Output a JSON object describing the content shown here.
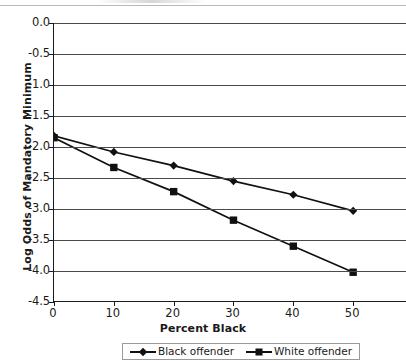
{
  "chart_data": {
    "type": "line",
    "title": "",
    "xlabel": "Percent Black",
    "ylabel": "Log Odds of Mandatory Minimum",
    "x": [
      0,
      10,
      20,
      30,
      40,
      50
    ],
    "xlim": [
      0,
      59
    ],
    "ylim": [
      -4.5,
      0.0
    ],
    "grid": true,
    "legend_position": "bottom",
    "xticks": [
      "0",
      "10",
      "20",
      "30",
      "40",
      "50"
    ],
    "yticks": [
      "0.0",
      "-0.5",
      "-1.0",
      "-1.5",
      "-2.0",
      "-2.5",
      "-3.0",
      "-3.5",
      "-4.0",
      "-4.5"
    ],
    "ytick_values": [
      0.0,
      -0.5,
      -1.0,
      -1.5,
      -2.0,
      -2.5,
      -3.0,
      -3.5,
      -4.0,
      -4.5
    ],
    "series": [
      {
        "name": "Black offender",
        "marker": "diamond",
        "values": [
          -1.82,
          -2.08,
          -2.3,
          -2.55,
          -2.77,
          -3.03
        ]
      },
      {
        "name": "White offender",
        "marker": "square",
        "values": [
          -1.85,
          -2.33,
          -2.72,
          -3.18,
          -3.6,
          -4.02
        ]
      }
    ]
  },
  "legend": {
    "entries": [
      {
        "label": "Black offender",
        "marker": "diamond"
      },
      {
        "label": "White offender",
        "marker": "square"
      }
    ]
  }
}
